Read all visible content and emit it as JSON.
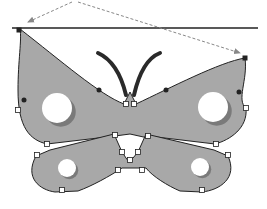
{
  "canvas": {
    "width": 267,
    "height": 209,
    "background": "#ffffff"
  },
  "colors": {
    "wing_fill": "#a8a8a8",
    "wing_stroke": "#222222",
    "spot_fill": "#ffffff",
    "spot_shadow": "#7a7a7a",
    "antenna": "#2a2a2a",
    "guide_line": "#222222",
    "arrow": "#888888",
    "anchor_fill": "#ffffff",
    "anchor_stroke": "#222222",
    "smooth_point": "#222222"
  },
  "guide_line": {
    "x1": 12,
    "y1": 28,
    "x2": 258,
    "y2": 28
  },
  "arrows": [
    {
      "name": "arrow-to-left-corner",
      "from": [
        72,
        2
      ],
      "to": [
        28,
        22
      ]
    },
    {
      "name": "arrow-to-right-corner",
      "from": [
        78,
        2
      ],
      "to": [
        240,
        53
      ]
    }
  ],
  "antennae": [
    {
      "name": "left-antenna",
      "d": "M98 53 Q118 62 126 95"
    },
    {
      "name": "right-antenna",
      "d": "M160 53 Q142 60 134 95"
    }
  ],
  "upper_wings_path": "M20 29 C 60 60, 100 95, 124 104 L 130 92 L 136 104 C 170 88, 220 62, 245 58 C 248 80, 236 100, 246 108 C 248 128, 230 140, 215 144 L 148 136 L 148 138 L 130 134 L 115 136 L 47 144 C 30 140, 18 128, 18 90 C 18 60, 22 40, 20 29 Z",
  "lower_wings_path": "M114 134 L 122 152 L 126 158 L 129 162 L 133 158 L 138 152 L 146 134 L 214 150 L 228 156 C 238 178, 220 190, 202 192 L 180 191 C 168 186, 152 176, 146 168 L 136 168 L 128 168 L 122 168 C 110 176, 92 186, 78 191 L 55 192 C 40 190, 24 178, 36 156 L 50 150 Z",
  "spots": [
    {
      "name": "upper-left-spot",
      "cx": 57,
      "cy": 108,
      "r": 15
    },
    {
      "name": "upper-right-spot",
      "cx": 213,
      "cy": 107,
      "r": 15
    },
    {
      "name": "lower-left-spot",
      "cx": 67,
      "cy": 168,
      "r": 9
    },
    {
      "name": "lower-right-spot",
      "cx": 200,
      "cy": 167,
      "r": 9
    }
  ],
  "corner_anchors": [
    [
      19,
      30
    ],
    [
      245,
      58
    ]
  ],
  "square_anchors": [
    [
      18,
      110
    ],
    [
      126,
      104
    ],
    [
      134,
      104
    ],
    [
      246,
      108
    ],
    [
      47,
      144
    ],
    [
      115,
      135
    ],
    [
      148,
      136
    ],
    [
      216,
      144
    ],
    [
      37,
      155
    ],
    [
      228,
      155
    ],
    [
      122,
      152
    ],
    [
      138,
      152
    ],
    [
      130,
      160
    ],
    [
      118,
      170
    ],
    [
      142,
      170
    ],
    [
      62,
      190
    ],
    [
      202,
      190
    ]
  ],
  "smooth_points": [
    [
      24,
      100
    ],
    [
      99,
      90
    ],
    [
      166,
      90
    ],
    [
      239,
      92
    ]
  ]
}
